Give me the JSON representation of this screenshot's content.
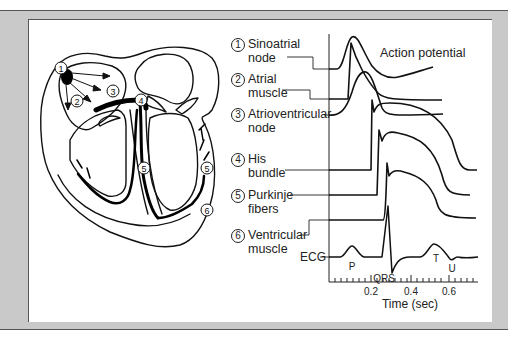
{
  "figure": {
    "title_annotation": "Action potential",
    "heart_markers": [
      "1",
      "2",
      "3",
      "4",
      "5",
      "5",
      "6"
    ],
    "labels": [
      {
        "num": "1",
        "line1": "Sinoatrial",
        "line2": "node"
      },
      {
        "num": "2",
        "line1": "Atrial",
        "line2": "muscle"
      },
      {
        "num": "3",
        "line1": "Atrioventricular",
        "line2": "node"
      },
      {
        "num": "4",
        "line1": "His",
        "line2": "bundle"
      },
      {
        "num": "5",
        "line1": "Purkinje",
        "line2": "fibers"
      },
      {
        "num": "6",
        "line1": "Ventricular",
        "line2": "muscle"
      }
    ],
    "ecg": {
      "label": "ECG",
      "waves": {
        "p": "P",
        "qrs": "QRS",
        "t": "T",
        "u": "U"
      }
    },
    "axis": {
      "xlabel": "Time (sec)",
      "ticks": [
        "0.2",
        "0.4",
        "0.6"
      ]
    },
    "colors": {
      "frame": "#c9c9c9",
      "ink": "#111111",
      "panel": "#ffffff"
    }
  }
}
